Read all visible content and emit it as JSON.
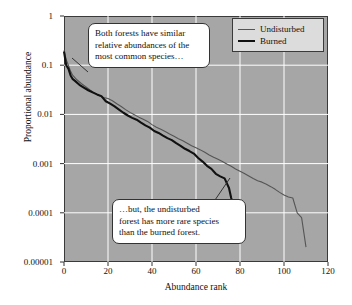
{
  "chart_data": {
    "type": "line",
    "title": "",
    "subtitle": "",
    "xlabel": "Abundance rank",
    "ylabel": "Proportional abundance",
    "xlim": [
      0,
      120
    ],
    "ylim": [
      1e-05,
      1
    ],
    "yscale": "log",
    "xticks": [
      0,
      20,
      40,
      60,
      80,
      100,
      120
    ],
    "xticklabels": [
      "0",
      "20",
      "40",
      "60",
      "80",
      "100",
      "120"
    ],
    "yticks": [
      1,
      0.1,
      0.01,
      0.001,
      0.0001,
      1e-05
    ],
    "yticklabels": [
      "1",
      "0.1",
      "0.01",
      "0.001",
      "0.0001",
      "0.00001"
    ],
    "grid": true,
    "grid_color": "#ffffff",
    "plot_background": "#a6a6a6",
    "legend_position": "top-right",
    "series": [
      {
        "name": "Undisturbed",
        "color": "#555555",
        "width": 1.1,
        "x": [
          0,
          1,
          2,
          3,
          4,
          6,
          8,
          10,
          12,
          14,
          16,
          18,
          20,
          22,
          24,
          26,
          28,
          30,
          32,
          34,
          36,
          38,
          40,
          42,
          44,
          46,
          48,
          50,
          52,
          54,
          56,
          58,
          60,
          62,
          64,
          66,
          68,
          70,
          72,
          74,
          76,
          78,
          80,
          82,
          84,
          86,
          88,
          90,
          92,
          94,
          96,
          98,
          100,
          102,
          104,
          106,
          108,
          110
        ],
        "y": [
          0.2,
          0.13,
          0.1,
          0.075,
          0.062,
          0.05,
          0.042,
          0.036,
          0.031,
          0.027,
          0.024,
          0.022,
          0.021,
          0.019,
          0.0165,
          0.0145,
          0.0125,
          0.011,
          0.0098,
          0.0088,
          0.008,
          0.0072,
          0.0062,
          0.0055,
          0.005,
          0.0045,
          0.004,
          0.0036,
          0.0032,
          0.0029,
          0.0026,
          0.0023,
          0.0021,
          0.0019,
          0.0017,
          0.0015,
          0.00135,
          0.00122,
          0.0011,
          0.00098,
          0.00088,
          0.00078,
          0.0007,
          0.00063,
          0.00056,
          0.0005,
          0.00045,
          0.00042,
          0.00038,
          0.00034,
          0.0003,
          0.00026,
          0.00023,
          0.00021,
          0.0002,
          0.0001,
          8e-05,
          2e-05
        ]
      },
      {
        "name": "Burned",
        "color": "#111111",
        "width": 2.1,
        "x": [
          0,
          1,
          2,
          3,
          4,
          5,
          7,
          9,
          11,
          13,
          15,
          17,
          19,
          21,
          23,
          25,
          27,
          29,
          31,
          33,
          35,
          37,
          39,
          41,
          43,
          45,
          47,
          49,
          51,
          53,
          55,
          57,
          59,
          61,
          63,
          65,
          67,
          69,
          71,
          73,
          75,
          76,
          77,
          78,
          78.5
        ],
        "y": [
          0.19,
          0.1,
          0.085,
          0.062,
          0.052,
          0.048,
          0.04,
          0.035,
          0.031,
          0.028,
          0.0255,
          0.0235,
          0.0185,
          0.0165,
          0.0145,
          0.0125,
          0.0108,
          0.0095,
          0.0085,
          0.0078,
          0.0068,
          0.006,
          0.0054,
          0.0046,
          0.0042,
          0.0037,
          0.0033,
          0.003,
          0.0026,
          0.0023,
          0.002,
          0.0018,
          0.0016,
          0.0013,
          0.0011,
          0.0009,
          0.00078,
          0.00062,
          0.00055,
          0.0005,
          0.00032,
          0.0002,
          0.00014,
          0.00011,
          4e-05
        ]
      }
    ],
    "annotations": [
      {
        "id": "callout-top",
        "lines": [
          "Both forests have similar",
          "relative abundances of the",
          "most common species…"
        ]
      },
      {
        "id": "callout-bottom",
        "lines": [
          "…but, the undisturbed",
          "forest has more rare species",
          "than the burned forest."
        ]
      }
    ]
  }
}
